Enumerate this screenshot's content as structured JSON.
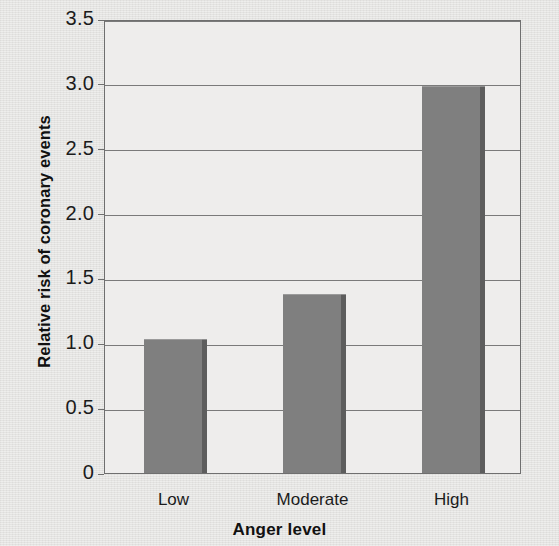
{
  "chart_data": {
    "type": "bar",
    "title": "",
    "xlabel": "Anger level",
    "ylabel": "Relative risk of coronary events",
    "categories": [
      "Low",
      "Moderate",
      "High"
    ],
    "values": [
      1.03,
      1.38,
      2.98
    ],
    "ylim": [
      0,
      3.5
    ],
    "yticks": [
      0,
      0.5,
      1.0,
      1.5,
      2.0,
      2.5,
      3.0,
      3.5
    ],
    "ytick_labels": [
      "0",
      "0.5",
      "1.0",
      "1.5",
      "2.0",
      "2.5",
      "3.0",
      "3.5"
    ],
    "grid": "horizontal",
    "legend": "none",
    "series": [
      {
        "name": "Relative risk of coronary events",
        "values": [
          1.03,
          1.38,
          2.98
        ],
        "color": "#7f7f7f"
      }
    ],
    "colors": {
      "bar_fill": "#7f7f7f",
      "bar_shadow": "#5d5d5d",
      "plot_background": "#eeedec",
      "figure_background": "#e4e3e1",
      "axis_line": "#6f6f6f",
      "gridline": "#7a7a7a",
      "text": "#1b1b1b"
    }
  }
}
